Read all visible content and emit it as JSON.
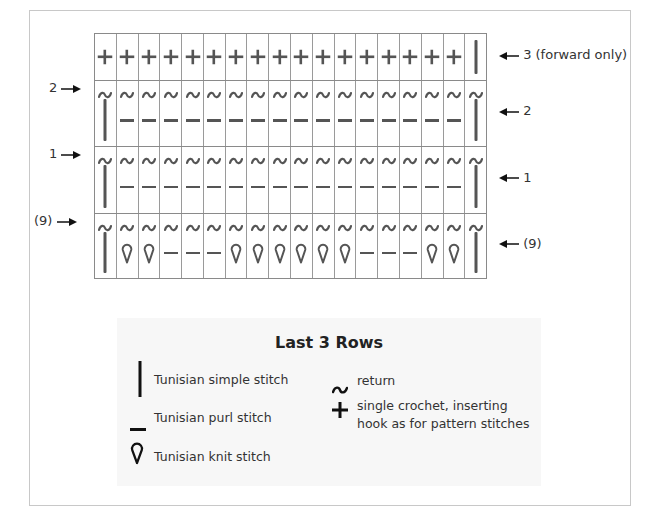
{
  "diagram": {
    "type": "crochet-stitch-chart",
    "columns": 18,
    "rows": [
      {
        "id": "row3",
        "left_label": "",
        "right_label": "3 (forward only)",
        "return": false,
        "stitches": [
          "plus",
          "plus",
          "plus",
          "plus",
          "plus",
          "plus",
          "plus",
          "plus",
          "plus",
          "plus",
          "plus",
          "plus",
          "plus",
          "plus",
          "plus",
          "plus",
          "plus",
          "simple"
        ]
      },
      {
        "id": "row2",
        "left_label": "2",
        "right_label": "2",
        "return": true,
        "stitches": [
          "simple",
          "purl",
          "purl",
          "purl",
          "purl",
          "purl",
          "purl",
          "purl",
          "purl",
          "purl",
          "purl",
          "purl",
          "purl",
          "purl",
          "purl",
          "purl",
          "purl",
          "simple"
        ]
      },
      {
        "id": "row1",
        "left_label": "1",
        "right_label": "1",
        "return": true,
        "stitches": [
          "simple",
          "purl",
          "purl",
          "purl",
          "purl",
          "purl",
          "purl",
          "purl",
          "purl",
          "purl",
          "purl",
          "purl",
          "purl",
          "purl",
          "purl",
          "purl",
          "purl",
          "simple"
        ]
      },
      {
        "id": "row9",
        "left_label": "(9)",
        "right_label": "(9)",
        "return": true,
        "stitches": [
          "simple",
          "knit",
          "knit",
          "purl",
          "purl",
          "purl",
          "knit",
          "knit",
          "knit",
          "knit",
          "knit",
          "knit",
          "purl",
          "purl",
          "purl",
          "knit",
          "knit",
          "simple"
        ]
      }
    ]
  },
  "legend": {
    "title": "Last 3 Rows",
    "items": [
      {
        "icon": "simple-stitch-icon",
        "label": "Tunisian simple stitch"
      },
      {
        "icon": "purl-stitch-icon",
        "label": "Tunisian purl stitch"
      },
      {
        "icon": "knit-stitch-icon",
        "label": "Tunisian knit stitch"
      },
      {
        "icon": "return-icon",
        "label": "return"
      },
      {
        "icon": "single-crochet-icon",
        "label_line1": "single crochet, inserting",
        "label_line2": "hook as for pattern stitches"
      }
    ]
  },
  "colors": {
    "symbol": "#555555",
    "grid": "#8a8a8a",
    "legend_bg": "#f7f7f7",
    "frame": "#c8c8c8"
  }
}
